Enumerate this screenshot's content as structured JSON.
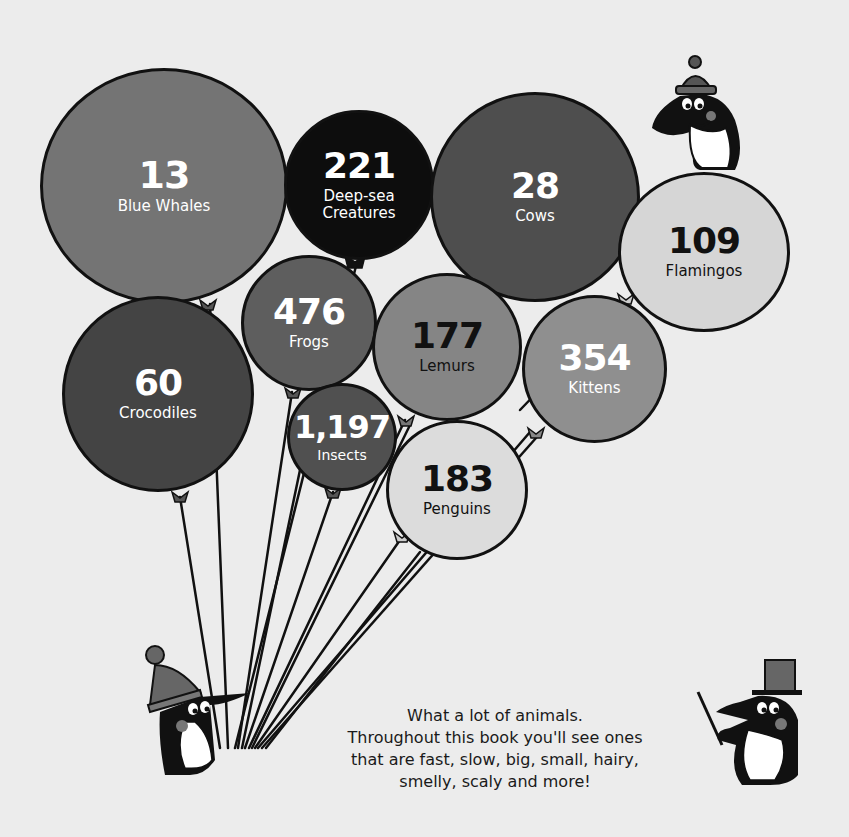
{
  "chart_data": {
    "type": "bubble",
    "title": "",
    "note": "Illustrated balloon bubble chart; each balloon shows a count and an animal name",
    "categories": [
      "Blue Whales",
      "Deep-sea Creatures",
      "Cows",
      "Flamingos",
      "Crocodiles",
      "Frogs",
      "Lemurs",
      "Kittens",
      "Insects",
      "Penguins"
    ],
    "values": [
      13,
      221,
      28,
      109,
      60,
      476,
      177,
      354,
      1197,
      183
    ],
    "display_values": [
      "13",
      "221",
      "28",
      "109",
      "60",
      "476",
      "177",
      "354",
      "1,197",
      "183"
    ],
    "legend": [],
    "grid": false
  },
  "balloons": [
    {
      "value": "13",
      "label": "Blue Whales",
      "label2": "",
      "x": 40,
      "y": 68,
      "w": 248,
      "h": 236,
      "fill": "#747474",
      "text": "#ffffff",
      "num_size": 38,
      "lbl_size": 15
    },
    {
      "value": "221",
      "label": "Deep-sea",
      "label2": "Creatures",
      "x": 284,
      "y": 110,
      "w": 150,
      "h": 150,
      "fill": "#0d0d0d",
      "text": "#ffffff",
      "num_size": 36,
      "lbl_size": 15
    },
    {
      "value": "28",
      "label": "Cows",
      "label2": "",
      "x": 430,
      "y": 92,
      "w": 210,
      "h": 210,
      "fill": "#4e4e4e",
      "text": "#ffffff",
      "num_size": 36,
      "lbl_size": 15
    },
    {
      "value": "109",
      "label": "Flamingos",
      "label2": "",
      "x": 618,
      "y": 172,
      "w": 172,
      "h": 160,
      "fill": "#d6d6d6",
      "text": "#111111",
      "num_size": 36,
      "lbl_size": 15
    },
    {
      "value": "60",
      "label": "Crocodiles",
      "label2": "",
      "x": 62,
      "y": 296,
      "w": 192,
      "h": 196,
      "fill": "#444444",
      "text": "#ffffff",
      "num_size": 36,
      "lbl_size": 15
    },
    {
      "value": "476",
      "label": "Frogs",
      "label2": "",
      "x": 241,
      "y": 255,
      "w": 136,
      "h": 136,
      "fill": "#5e5e5e",
      "text": "#ffffff",
      "num_size": 36,
      "lbl_size": 15
    },
    {
      "value": "177",
      "label": "Lemurs",
      "label2": "",
      "x": 372,
      "y": 273,
      "w": 150,
      "h": 148,
      "fill": "#858585",
      "text": "#111111",
      "num_size": 36,
      "lbl_size": 15
    },
    {
      "value": "354",
      "label": "Kittens",
      "label2": "",
      "x": 522,
      "y": 295,
      "w": 145,
      "h": 148,
      "fill": "#8f8f8f",
      "text": "#ffffff",
      "num_size": 36,
      "lbl_size": 15
    },
    {
      "value": "1,197",
      "label": "Insects",
      "label2": "",
      "x": 287,
      "y": 383,
      "w": 110,
      "h": 108,
      "fill": "#505050",
      "text": "#ffffff",
      "num_size": 32,
      "lbl_size": 14
    },
    {
      "value": "183",
      "label": "Penguins",
      "label2": "",
      "x": 386,
      "y": 420,
      "w": 142,
      "h": 140,
      "fill": "#dcdcdc",
      "text": "#111111",
      "num_size": 36,
      "lbl_size": 15
    }
  ],
  "caption": {
    "line1": "What a lot of animals.",
    "line2": "Throughout this book you'll see ones",
    "line3": "that are fast, slow, big, small, hairy,",
    "line4": "smelly, scaly and more!"
  },
  "characters": [
    {
      "name": "penguin-with-beanie-on-balloon"
    },
    {
      "name": "penguin-holding-balloons"
    },
    {
      "name": "penguin-with-top-hat-and-baton"
    }
  ]
}
